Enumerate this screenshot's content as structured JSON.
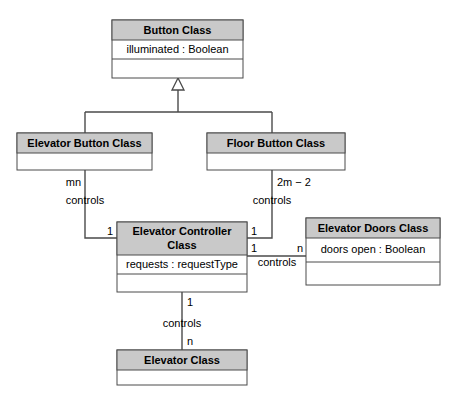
{
  "diagram": {
    "type": "uml-class-diagram",
    "colors": {
      "header_fill": "#c9c9c9",
      "body_fill": "#ffffff",
      "line": "#4a4a4a",
      "text": "#000000",
      "background": "#ffffff"
    },
    "classes": [
      {
        "id": "button-class",
        "name": "Button Class",
        "attributes": [
          "illuminated : Boolean"
        ],
        "operations": [],
        "x": 112,
        "y": 20,
        "w": 131,
        "h": 58,
        "header_h": 20,
        "attr_h": 19
      },
      {
        "id": "elevator-button-class",
        "name": "Elevator Button Class",
        "attributes": [],
        "operations": [],
        "x": 17,
        "y": 133,
        "w": 135,
        "h": 37,
        "header_h": 20,
        "attr_h": 17
      },
      {
        "id": "floor-button-class",
        "name": "Floor Button Class",
        "attributes": [],
        "operations": [],
        "x": 207,
        "y": 133,
        "w": 138,
        "h": 37,
        "header_h": 20,
        "attr_h": 17
      },
      {
        "id": "elevator-controller-class",
        "name": "Elevator Controller Class",
        "attributes": [
          "requests : requestType"
        ],
        "operations": [],
        "x": 117,
        "y": 222,
        "w": 130,
        "h": 70,
        "header_h": 33,
        "attr_h": 19
      },
      {
        "id": "elevator-doors-class",
        "name": "Elevator Doors Class",
        "attributes": [
          "doors open : Boolean"
        ],
        "operations": [],
        "x": 306,
        "y": 218,
        "w": 134,
        "h": 67,
        "header_h": 20,
        "attr_h": 23
      },
      {
        "id": "elevator-class",
        "name": "Elevator Class",
        "attributes": [],
        "operations": [],
        "x": 117,
        "y": 350,
        "w": 130,
        "h": 35,
        "header_h": 20,
        "attr_h": 15
      }
    ],
    "generalization": {
      "parent": "Button Class",
      "children": [
        "Elevator Button Class",
        "Floor Button Class"
      ],
      "triangle_apex_y": 78,
      "triangle_base_y": 90,
      "trunk_bottom_y": 112,
      "bar_y": 112,
      "bar_left_x": 85,
      "bar_right_x": 272,
      "center_x": 178
    },
    "associations": [
      {
        "id": "elevator-button-controls-controller",
        "from": "Elevator Button Class",
        "to": "Elevator Controller Class",
        "label": "controls",
        "from_multiplicity": "mn",
        "to_multiplicity": "1",
        "label_x": 85,
        "label_y": 201,
        "from_mult_x": 81,
        "from_mult_y": 183,
        "to_mult_x": 113,
        "to_mult_y": 232
      },
      {
        "id": "floor-button-controls-controller",
        "from": "Floor Button Class",
        "to": "Elevator Controller Class",
        "label": "controls",
        "from_multiplicity": "2m − 2",
        "to_multiplicity": "1",
        "label_x": 272,
        "label_y": 201,
        "from_mult_x": 277,
        "from_mult_y": 183,
        "to_mult_x": 251,
        "to_mult_y": 232
      },
      {
        "id": "controller-controls-doors",
        "from": "Elevator Controller Class",
        "to": "Elevator Doors Class",
        "label": "controls",
        "from_multiplicity": "1",
        "to_multiplicity": "n",
        "label_x": 277,
        "label_y": 262,
        "from_mult_x": 251,
        "from_mult_y": 249,
        "to_mult_x": 302,
        "to_mult_y": 249
      },
      {
        "id": "controller-controls-elevator",
        "from": "Elevator Controller Class",
        "to": "Elevator Class",
        "label": "controls",
        "from_multiplicity": "1",
        "to_multiplicity": "n",
        "label_x": 182,
        "label_y": 324,
        "from_mult_x": 187,
        "from_mult_y": 303,
        "to_mult_x": 187,
        "to_mult_y": 342
      }
    ]
  }
}
